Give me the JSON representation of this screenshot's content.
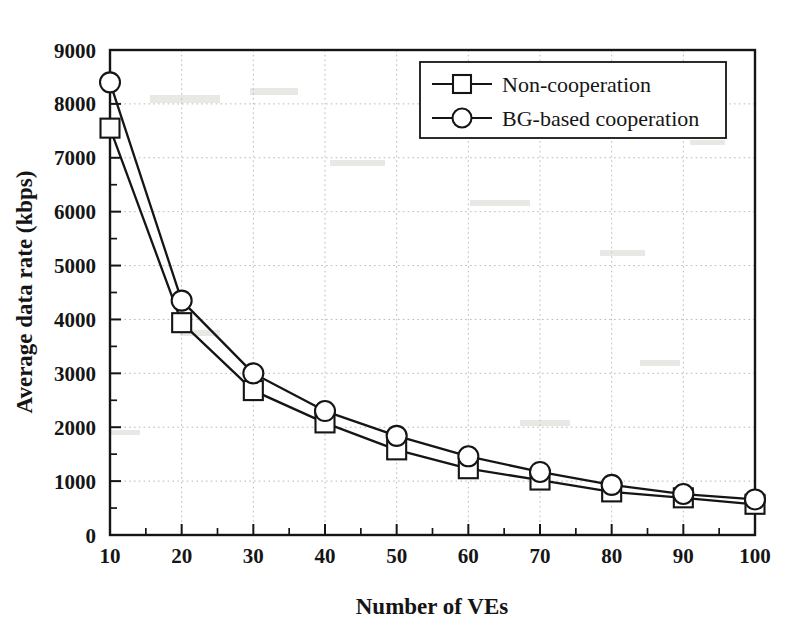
{
  "chart_data": {
    "type": "line",
    "title": "",
    "xlabel": "Number of VEs",
    "ylabel": "Average data rate (kbps)",
    "x": [
      10,
      20,
      30,
      40,
      50,
      60,
      70,
      80,
      90,
      100
    ],
    "xlim": [
      10,
      100
    ],
    "ylim": [
      0,
      9000
    ],
    "xticks": [
      "10",
      "20",
      "30",
      "40",
      "50",
      "60",
      "70",
      "80",
      "90",
      "100"
    ],
    "yticks": [
      "0",
      "1000",
      "2000",
      "3000",
      "4000",
      "5000",
      "6000",
      "7000",
      "8000",
      "9000"
    ],
    "x_minor_tick_step": 5,
    "y_minor_tick_step": 500,
    "grid": true,
    "grid_style": "dotted",
    "legend_position": "top-right",
    "series": [
      {
        "name": "Non-cooperation",
        "marker": "square",
        "values": [
          7550,
          3940,
          2680,
          2080,
          1580,
          1230,
          1020,
          800,
          690,
          570
        ]
      },
      {
        "name": "BG-based cooperation",
        "marker": "circle",
        "values": [
          8400,
          4350,
          3000,
          2300,
          1840,
          1460,
          1170,
          930,
          760,
          660
        ]
      }
    ]
  },
  "legend": {
    "entries": [
      {
        "label": "Non-cooperation",
        "marker": "square"
      },
      {
        "label": "BG-based cooperation",
        "marker": "circle"
      }
    ]
  },
  "colors": {
    "line": "#151515",
    "marker_fill": "#ffffff",
    "grid": "#b8b8b8",
    "background": "#ffffff"
  }
}
